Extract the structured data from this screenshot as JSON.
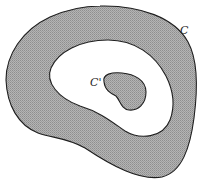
{
  "figure": {
    "labels": {
      "outer_curve": "C",
      "inner_curve": "C'"
    },
    "colors": {
      "shading": "#a8a8a8",
      "outline": "#1e1e1e",
      "background": "#ffffff"
    }
  }
}
